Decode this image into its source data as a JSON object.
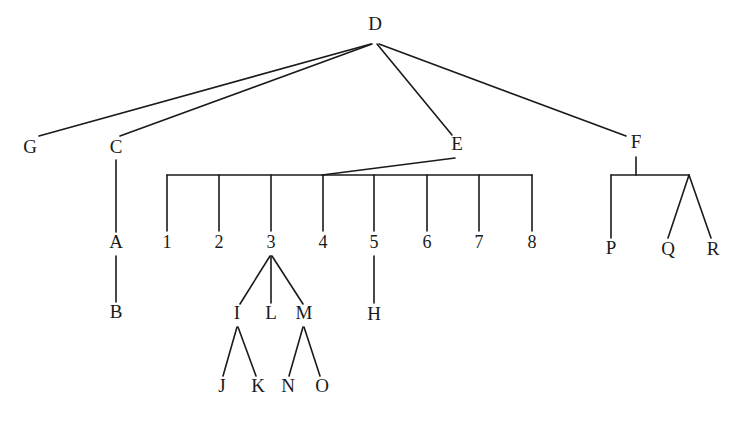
{
  "diagram": {
    "type": "tree",
    "root": "D",
    "nodes": [
      {
        "id": "D",
        "label": "D",
        "x": 375,
        "y": 26
      },
      {
        "id": "G",
        "label": "G",
        "x": 30,
        "y": 149
      },
      {
        "id": "C",
        "label": "C",
        "x": 116,
        "y": 149
      },
      {
        "id": "E",
        "label": "E",
        "x": 457,
        "y": 146
      },
      {
        "id": "F",
        "label": "F",
        "x": 636,
        "y": 144
      },
      {
        "id": "A",
        "label": "A",
        "x": 116,
        "y": 244
      },
      {
        "id": "B",
        "label": "B",
        "x": 116,
        "y": 314
      },
      {
        "id": "n1",
        "label": "1",
        "x": 167,
        "y": 244
      },
      {
        "id": "n2",
        "label": "2",
        "x": 219,
        "y": 244
      },
      {
        "id": "n3",
        "label": "3",
        "x": 271,
        "y": 244
      },
      {
        "id": "n4",
        "label": "4",
        "x": 323,
        "y": 244
      },
      {
        "id": "n5",
        "label": "5",
        "x": 374,
        "y": 244
      },
      {
        "id": "n6",
        "label": "6",
        "x": 427,
        "y": 244
      },
      {
        "id": "n7",
        "label": "7",
        "x": 479,
        "y": 244
      },
      {
        "id": "n8",
        "label": "8",
        "x": 532,
        "y": 244
      },
      {
        "id": "H",
        "label": "H",
        "x": 374,
        "y": 316
      },
      {
        "id": "I",
        "label": "I",
        "x": 237,
        "y": 315
      },
      {
        "id": "L",
        "label": "L",
        "x": 271,
        "y": 315
      },
      {
        "id": "M",
        "label": "M",
        "x": 304,
        "y": 315
      },
      {
        "id": "J",
        "label": "J",
        "x": 222,
        "y": 388
      },
      {
        "id": "K",
        "label": "K",
        "x": 258,
        "y": 388
      },
      {
        "id": "N",
        "label": "N",
        "x": 288,
        "y": 388
      },
      {
        "id": "O",
        "label": "O",
        "x": 322,
        "y": 388
      },
      {
        "id": "P",
        "label": "P",
        "x": 611,
        "y": 250
      },
      {
        "id": "Q",
        "label": "Q",
        "x": 668,
        "y": 251
      },
      {
        "id": "R",
        "label": "R",
        "x": 713,
        "y": 251
      }
    ],
    "edges": [
      {
        "from": "D",
        "to": "G"
      },
      {
        "from": "D",
        "to": "C"
      },
      {
        "from": "D",
        "to": "E"
      },
      {
        "from": "D",
        "to": "F"
      },
      {
        "from": "C",
        "to": "A"
      },
      {
        "from": "A",
        "to": "B"
      },
      {
        "from": "E",
        "to": "n1"
      },
      {
        "from": "E",
        "to": "n2"
      },
      {
        "from": "E",
        "to": "n3"
      },
      {
        "from": "E",
        "to": "n4"
      },
      {
        "from": "E",
        "to": "n5"
      },
      {
        "from": "E",
        "to": "n6"
      },
      {
        "from": "E",
        "to": "n7"
      },
      {
        "from": "E",
        "to": "n8"
      },
      {
        "from": "n3",
        "to": "I"
      },
      {
        "from": "n3",
        "to": "L"
      },
      {
        "from": "n3",
        "to": "M"
      },
      {
        "from": "I",
        "to": "J"
      },
      {
        "from": "I",
        "to": "K"
      },
      {
        "from": "M",
        "to": "N"
      },
      {
        "from": "M",
        "to": "O"
      },
      {
        "from": "n5",
        "to": "H"
      },
      {
        "from": "F",
        "to": "P"
      },
      {
        "from": "F",
        "to": "Q"
      },
      {
        "from": "F",
        "to": "R"
      }
    ],
    "segments": [
      {
        "name": "edge-D-G",
        "x1": 371,
        "y1": 44,
        "x2": 39,
        "y2": 136
      },
      {
        "name": "edge-D-C",
        "x1": 372,
        "y1": 44,
        "x2": 120,
        "y2": 136
      },
      {
        "name": "edge-D-E",
        "x1": 377,
        "y1": 44,
        "x2": 452,
        "y2": 135
      },
      {
        "name": "edge-D-F",
        "x1": 379,
        "y1": 44,
        "x2": 626,
        "y2": 136
      },
      {
        "name": "edge-C-A",
        "x1": 116,
        "y1": 160,
        "x2": 116,
        "y2": 232
      },
      {
        "name": "edge-A-B",
        "x1": 116,
        "y1": 256,
        "x2": 116,
        "y2": 302
      },
      {
        "name": "edge-E-bracket",
        "x1": 455,
        "y1": 158,
        "x2": 322,
        "y2": 175
      },
      {
        "name": "bracket-E",
        "x1": 167,
        "y1": 175,
        "x2": 532,
        "y2": 175
      },
      {
        "name": "edge-E-1",
        "x1": 167,
        "y1": 175,
        "x2": 167,
        "y2": 231
      },
      {
        "name": "edge-E-2",
        "x1": 219,
        "y1": 175,
        "x2": 219,
        "y2": 231
      },
      {
        "name": "edge-E-3",
        "x1": 271,
        "y1": 175,
        "x2": 271,
        "y2": 231
      },
      {
        "name": "edge-E-4",
        "x1": 323,
        "y1": 175,
        "x2": 323,
        "y2": 231
      },
      {
        "name": "edge-E-5",
        "x1": 374,
        "y1": 175,
        "x2": 374,
        "y2": 231
      },
      {
        "name": "edge-E-6",
        "x1": 427,
        "y1": 175,
        "x2": 427,
        "y2": 231
      },
      {
        "name": "edge-E-7",
        "x1": 479,
        "y1": 175,
        "x2": 479,
        "y2": 231
      },
      {
        "name": "edge-E-8",
        "x1": 532,
        "y1": 175,
        "x2": 532,
        "y2": 231
      },
      {
        "name": "edge-5-H",
        "x1": 374,
        "y1": 256,
        "x2": 374,
        "y2": 303
      },
      {
        "name": "edge-3-I",
        "x1": 270,
        "y1": 256,
        "x2": 240,
        "y2": 304
      },
      {
        "name": "edge-3-L",
        "x1": 271,
        "y1": 256,
        "x2": 271,
        "y2": 303
      },
      {
        "name": "edge-3-M",
        "x1": 272,
        "y1": 256,
        "x2": 303,
        "y2": 304
      },
      {
        "name": "edge-I-J",
        "x1": 237,
        "y1": 327,
        "x2": 223,
        "y2": 376
      },
      {
        "name": "edge-I-K",
        "x1": 238,
        "y1": 327,
        "x2": 256,
        "y2": 376
      },
      {
        "name": "edge-M-N",
        "x1": 303,
        "y1": 327,
        "x2": 289,
        "y2": 376
      },
      {
        "name": "edge-M-O",
        "x1": 304,
        "y1": 327,
        "x2": 320,
        "y2": 376
      },
      {
        "name": "edge-F-stem",
        "x1": 636,
        "y1": 157,
        "x2": 636,
        "y2": 175
      },
      {
        "name": "bracket-F",
        "x1": 611,
        "y1": 175,
        "x2": 689,
        "y2": 175
      },
      {
        "name": "edge-F-P",
        "x1": 611,
        "y1": 175,
        "x2": 611,
        "y2": 238
      },
      {
        "name": "edge-F-Q",
        "x1": 689,
        "y1": 175,
        "x2": 668,
        "y2": 238
      },
      {
        "name": "edge-F-R",
        "x1": 689,
        "y1": 175,
        "x2": 711,
        "y2": 238
      }
    ],
    "colors": {
      "line": "#1a1a1a",
      "text": "#1a1a1a",
      "background": "#ffffff"
    }
  }
}
